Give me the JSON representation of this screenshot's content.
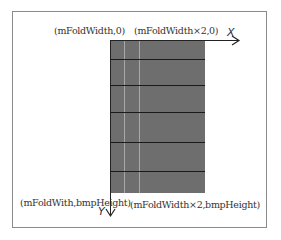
{
  "labels": {
    "top_left": "(mFoldWidth,0)",
    "top_right": "(mFoldWidth×2,0)",
    "bottom_left": "(mFoldWith,bmpHeight)",
    "bottom_right": "(mFoldWidth×2,bmpHeight)"
  },
  "axes": {
    "x": "X",
    "y": "Y"
  },
  "colors": {
    "bitmap": "#6e6e6e",
    "fold_line": "#a8a8a8",
    "row_line": "#1a1a1a",
    "frame": "#8a8a8a"
  }
}
